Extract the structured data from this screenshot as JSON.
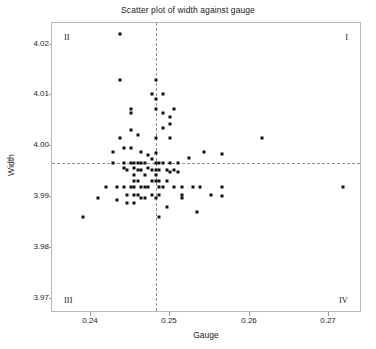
{
  "chart_data": {
    "type": "scatter",
    "title": "Scatter plot of width against gauge",
    "xlabel": "Gauge",
    "ylabel": "Width",
    "xlim": [
      0.2355,
      0.2745
    ],
    "ylim": [
      3.9655,
      4.0225
    ],
    "xticks": [
      0.24,
      0.25,
      0.26,
      0.27
    ],
    "xticklabels": [
      "0.24",
      "0.25",
      "0.26",
      "0.27"
    ],
    "yticks": [
      3.97,
      3.98,
      3.99,
      4.0,
      4.01,
      4.02
    ],
    "yticklabels": [
      "3.97",
      "3.98",
      "3.99",
      "4.00",
      "4.01",
      "4.02"
    ],
    "grid": false,
    "legend": null,
    "reference_lines": {
      "vertical_x": 0.2487,
      "horizontal_y": 3.9947,
      "style": "dashed",
      "color": "#8e8e8e"
    },
    "quadrant_labels": [
      {
        "name": "I",
        "position": "top-right"
      },
      {
        "name": "II",
        "position": "top-left"
      },
      {
        "name": "III",
        "position": "bottom-left"
      },
      {
        "name": "IV",
        "position": "bottom-right"
      }
    ],
    "marker": {
      "shape": "square",
      "color": "#111111",
      "size": 3
    },
    "x": [
      0.2394,
      0.2413,
      0.2423,
      0.2432,
      0.2432,
      0.2437,
      0.2437,
      0.2441,
      0.2441,
      0.2441,
      0.2446,
      0.2446,
      0.2446,
      0.2446,
      0.245,
      0.245,
      0.245,
      0.2455,
      0.2455,
      0.2455,
      0.2455,
      0.2455,
      0.2455,
      0.2459,
      0.2459,
      0.2459,
      0.2459,
      0.2459,
      0.2459,
      0.2459,
      0.2464,
      0.2464,
      0.2464,
      0.2464,
      0.2464,
      0.2468,
      0.2468,
      0.2468,
      0.2468,
      0.2468,
      0.2473,
      0.2473,
      0.2473,
      0.2473,
      0.2477,
      0.2477,
      0.2477,
      0.2482,
      0.2482,
      0.2482,
      0.2482,
      0.2482,
      0.2487,
      0.2487,
      0.2487,
      0.2487,
      0.2487,
      0.2487,
      0.2487,
      0.2487,
      0.2487,
      0.2487,
      0.2491,
      0.2491,
      0.2491,
      0.2491,
      0.2491,
      0.2491,
      0.2496,
      0.2496,
      0.2496,
      0.2496,
      0.2496,
      0.25,
      0.25,
      0.25,
      0.2505,
      0.2505,
      0.2505,
      0.2505,
      0.2505,
      0.251,
      0.251,
      0.251,
      0.2514,
      0.2514,
      0.2519,
      0.2519,
      0.2519,
      0.2528,
      0.2533,
      0.2538,
      0.2542,
      0.2547,
      0.2556,
      0.257,
      0.257,
      0.257,
      0.2621,
      0.2723
    ],
    "y": [
      3.9841,
      3.9878,
      3.99,
      3.997,
      3.9947,
      3.99,
      3.9875,
      4.0203,
      4.0113,
      3.9997,
      3.9978,
      3.9947,
      3.9938,
      3.99,
      3.9885,
      3.9869,
      3.9935,
      4.0055,
      4.0047,
      4.0013,
      3.9978,
      3.9947,
      3.99,
      3.9938,
      3.9925,
      3.9913,
      3.9885,
      3.9869,
      3.99,
      3.9947,
      4.0003,
      3.9947,
      3.9935,
      3.9913,
      3.9885,
      3.9969,
      3.9947,
      3.9935,
      3.99,
      3.9878,
      3.9947,
      3.9925,
      3.99,
      3.9878,
      3.9963,
      3.9938,
      3.99,
      4.0085,
      3.9955,
      3.9935,
      3.9913,
      3.9885,
      4.0113,
      4.0075,
      4.0055,
      3.9997,
      3.9968,
      3.9947,
      3.9935,
      3.9925,
      3.9913,
      3.9878,
      3.9947,
      3.9935,
      3.9913,
      3.99,
      3.9885,
      3.9841,
      4.0085,
      4.0047,
      4.0017,
      3.9947,
      3.99,
      3.9935,
      3.9913,
      3.9861,
      4.0038,
      4.0025,
      3.9997,
      3.9947,
      3.993,
      4.0055,
      3.9935,
      3.99,
      3.9947,
      3.993,
      3.9885,
      3.9878,
      3.99,
      3.9958,
      3.99,
      3.9851,
      3.99,
      3.9969,
      3.9885,
      3.9882,
      3.99,
      3.9966,
      3.9997,
      3.99
    ],
    "n_points": 102
  }
}
